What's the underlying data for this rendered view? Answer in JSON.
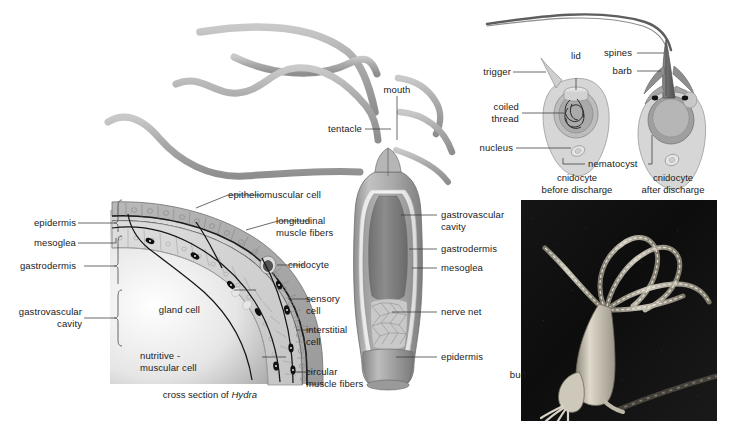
{
  "figure": {
    "width": 733,
    "height": 428,
    "background": "#ffffff"
  },
  "colors": {
    "tissue_light": "#cfcfcf",
    "tissue_mid": "#a8a8a8",
    "tissue_dark": "#808080",
    "epidermis": "#b4b4b4",
    "gastrodermis": "#d8d8d8",
    "mesoglea": "#efefef",
    "cavity": "#8f8f8f",
    "outline": "#555555",
    "label_text": "#1a1a1a",
    "leader_line": "#3a3a3a",
    "photo_background": "#0d0d0d",
    "photo_subject": "#d9d4c8"
  },
  "whole_animal": {
    "caption": "",
    "labels": {
      "tentacle": "tentacle",
      "mouth": "mouth",
      "gastrovascular_cavity": "gastrovascular\ncavity",
      "gastrodermis": "gastrodermis",
      "mesoglea": "mesoglea",
      "nerve_net": "nerve net",
      "epidermis": "epidermis"
    }
  },
  "cross_section": {
    "caption_plain": "cross section of ",
    "caption_italic": "Hydra",
    "left_labels": [
      {
        "key": "epidermis",
        "text": "epidermis"
      },
      {
        "key": "mesoglea",
        "text": "mesoglea"
      },
      {
        "key": "gastrodermis",
        "text": "gastrodermis"
      },
      {
        "key": "gastrovascular-cavity",
        "text": "gastrovascular\ncavity"
      }
    ],
    "right_labels": [
      {
        "key": "epitheliomuscular-cell",
        "text": "epitheliomuscular cell"
      },
      {
        "key": "longitudinal-muscle-fibers",
        "text": "longitudinal\nmuscle fibers"
      },
      {
        "key": "cnidocyte",
        "text": "cnidocyte"
      },
      {
        "key": "sensory-cell",
        "text": "sensory\ncell"
      },
      {
        "key": "interstitial-cell",
        "text": "interstitial\ncell"
      },
      {
        "key": "circular-muscle-fibers",
        "text": "circular\nmuscle fibers"
      }
    ],
    "interior_labels": [
      {
        "key": "gland-cell",
        "text": "gland cell"
      },
      {
        "key": "nutritive-muscular-cell",
        "text": "nutritive -\nmuscular cell"
      }
    ]
  },
  "cnidocyte_before": {
    "caption": "cnidocyte\nbefore discharge",
    "labels": {
      "trigger": "trigger",
      "lid": "lid",
      "coiled_thread": "coiled\nthread",
      "nucleus": "nucleus",
      "nematocyst": "nematocyst"
    }
  },
  "cnidocyte_after": {
    "caption": "cnidocyte\nafter discharge",
    "labels": {
      "spines": "spines",
      "barb": "barb"
    }
  },
  "photograph": {
    "labels": {
      "bud": "bud"
    }
  }
}
